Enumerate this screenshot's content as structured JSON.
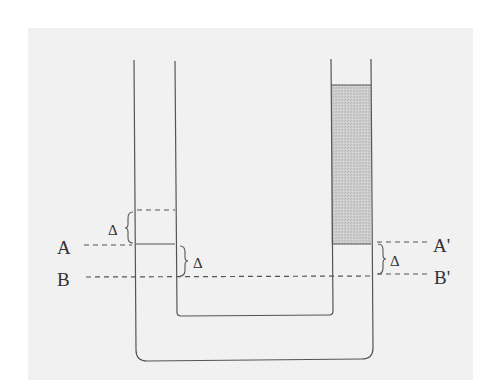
{
  "diagram": {
    "type": "U-tube manometer",
    "colors": {
      "paper": "#f1f1f1",
      "line": "#555555",
      "fluid": "#c8c8c8"
    },
    "labels": {
      "A": "A",
      "B": "B",
      "A_prime": "A'",
      "B_prime": "B'",
      "delta_left_upper": "Δ",
      "delta_left_lower": "Δ",
      "delta_right": "Δ"
    },
    "levels": [
      {
        "name": "A",
        "description": "left fluid level (solid meniscus)"
      },
      {
        "name": "B",
        "description": "reference level below A, offset by Δ"
      },
      {
        "name": "A'",
        "description": "right level at bottom of shaded fluid column"
      },
      {
        "name": "B'",
        "description": "reference level below A', offset by Δ"
      }
    ],
    "annotations": [
      "dashed level Δ above A in left arm",
      "shaded fluid column in right arm above A'"
    ]
  }
}
